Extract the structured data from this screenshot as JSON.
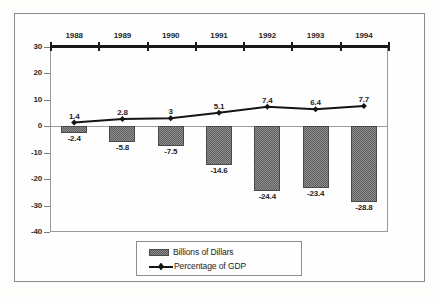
{
  "chart_data": {
    "type": "bar",
    "title": "",
    "subtitle": "",
    "xlabel": "",
    "ylabel": "",
    "categories": [
      "1988",
      "1989",
      "1990",
      "1991",
      "1992",
      "1993",
      "1994"
    ],
    "ylim": [
      -40,
      30
    ],
    "yticks": [
      "30",
      "20",
      "10",
      "0",
      "-10",
      "-20",
      "-30",
      "-40"
    ],
    "ytick_values": [
      30,
      20,
      10,
      0,
      -10,
      -20,
      -30,
      -40
    ],
    "grid": false,
    "legend_position": "bottom",
    "series": [
      {
        "name": "Billions of Dillars",
        "type": "bar",
        "values": [
          -2.4,
          -5.8,
          -7.5,
          -14.6,
          -24.4,
          -23.4,
          -28.8
        ],
        "labels": [
          "-2.4",
          "-5.8",
          "-7.5",
          "-14.6",
          "-24.4",
          "-23.4",
          "-28.8"
        ]
      },
      {
        "name": "Percentage of GDP",
        "type": "line",
        "values": [
          1.4,
          2.8,
          3,
          5.1,
          7.4,
          6.4,
          7.7
        ],
        "labels": [
          "1.4",
          "2.8",
          "3",
          "5.1",
          "7.4",
          "6.4",
          "7.7"
        ]
      }
    ]
  },
  "axis": {
    "top_axis_value": "30"
  },
  "legend": {
    "items": [
      {
        "label": "Billions of Dillars",
        "marker": "bar-swatch"
      },
      {
        "label": "Percentage of GDP",
        "marker": "line-marker"
      }
    ]
  },
  "colors": {
    "bar_fill": "#8e8e8e",
    "bar_edge": "#4a4a4a",
    "line": "#141414",
    "axis": "#9a9a9a",
    "text": "#1f1f1f",
    "background": "#fdfdfc"
  }
}
